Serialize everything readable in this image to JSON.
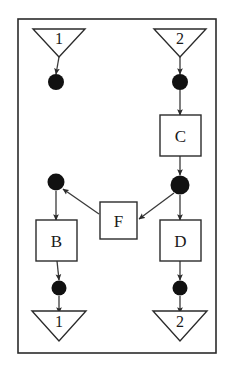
{
  "diagram": {
    "frame": {
      "name": "outer-frame",
      "x": 18,
      "y": 19,
      "width": 198,
      "height": 334,
      "stroke": "#2b2b2b",
      "fill": "#ffffff",
      "stroke_width": 1.6
    },
    "colors": {
      "stroke": "#2b2b2b",
      "line": "#3a3a3a",
      "place_fill": "#111111",
      "box_fill": "#ffffff",
      "background": "#ffffff",
      "text": "#1a1a1a"
    },
    "connectors": [
      {
        "id": "in-1",
        "label": "1",
        "role": "input-connector",
        "orientation": "down",
        "cx": 59,
        "y_top": 29,
        "half_width": 26,
        "height": 28,
        "label_dy": 9
      },
      {
        "id": "in-2",
        "label": "2",
        "role": "input-connector",
        "orientation": "down",
        "cx": 180,
        "y_top": 29,
        "half_width": 26,
        "height": 28,
        "label_dy": 9
      },
      {
        "id": "out-1",
        "label": "1",
        "role": "output-connector",
        "orientation": "down",
        "cx": 59,
        "y_top": 311,
        "half_width": 27,
        "height": 30,
        "label_dy": 10
      },
      {
        "id": "out-2",
        "label": "2",
        "role": "output-connector",
        "orientation": "down",
        "cx": 180,
        "y_top": 311,
        "half_width": 27,
        "height": 30,
        "label_dy": 10
      }
    ],
    "places": [
      {
        "id": "p-top-left",
        "role": "place",
        "cx": 56,
        "cy": 82,
        "r": 8
      },
      {
        "id": "p-top-right",
        "role": "place",
        "cx": 180,
        "cy": 82,
        "r": 8
      },
      {
        "id": "p-junction",
        "role": "place-junction",
        "cx": 180,
        "cy": 185,
        "r": 9.5
      },
      {
        "id": "p-mid-left",
        "role": "place",
        "cx": 56,
        "cy": 182,
        "r": 8.5
      },
      {
        "id": "p-bot-left",
        "role": "place",
        "cx": 59,
        "cy": 288,
        "r": 7.5
      },
      {
        "id": "p-bot-right",
        "role": "place",
        "cx": 180,
        "cy": 288,
        "r": 7.5
      }
    ],
    "boxes": [
      {
        "id": "box-c",
        "label": "C",
        "role": "transition",
        "x": 160,
        "y": 115,
        "width": 41,
        "height": 41
      },
      {
        "id": "box-b",
        "label": "B",
        "role": "transition",
        "x": 36,
        "y": 220,
        "width": 41,
        "height": 41
      },
      {
        "id": "box-d",
        "label": "D",
        "role": "transition",
        "x": 160,
        "y": 220,
        "width": 41,
        "height": 41
      },
      {
        "id": "box-f",
        "label": "F",
        "role": "transition",
        "x": 100,
        "y": 202,
        "width": 37,
        "height": 37
      }
    ],
    "edges": [
      {
        "id": "e-in1-ptl",
        "from": "in-1",
        "to": "p-top-left",
        "x1": 59,
        "y1": 57,
        "x2": 56,
        "y2": 74
      },
      {
        "id": "e-in2-ptr",
        "from": "in-2",
        "to": "p-top-right",
        "x1": 180,
        "y1": 57,
        "x2": 180,
        "y2": 74
      },
      {
        "id": "e-ptr-c",
        "from": "p-top-right",
        "to": "box-c",
        "x1": 180,
        "y1": 90,
        "x2": 180,
        "y2": 115
      },
      {
        "id": "e-c-junc",
        "from": "box-c",
        "to": "p-junction",
        "x1": 180,
        "y1": 156,
        "x2": 180,
        "y2": 175
      },
      {
        "id": "e-junc-f",
        "from": "p-junction",
        "to": "box-f",
        "x1": 174,
        "y1": 193,
        "x2": 139,
        "y2": 219
      },
      {
        "id": "e-f-pml",
        "from": "box-f",
        "to": "p-mid-left",
        "x1": 99,
        "y1": 214,
        "x2": 63,
        "y2": 189
      },
      {
        "id": "e-junc-d",
        "from": "p-junction",
        "to": "box-d",
        "x1": 180,
        "y1": 195,
        "x2": 180,
        "y2": 220
      },
      {
        "id": "e-pml-b",
        "from": "p-mid-left",
        "to": "box-b",
        "x1": 56,
        "y1": 191,
        "x2": 56,
        "y2": 220
      },
      {
        "id": "e-b-pbl",
        "from": "box-b",
        "to": "p-bot-left",
        "x1": 57,
        "y1": 261,
        "x2": 59,
        "y2": 280
      },
      {
        "id": "e-d-pbr",
        "from": "box-d",
        "to": "p-bot-right",
        "x1": 180,
        "y1": 261,
        "x2": 180,
        "y2": 280
      },
      {
        "id": "e-pbl-out1",
        "from": "p-bot-left",
        "to": "out-1",
        "x1": 59,
        "y1": 296,
        "x2": 59,
        "y2": 313
      },
      {
        "id": "e-pbr-out2",
        "from": "p-bot-right",
        "to": "out-2",
        "x1": 180,
        "y1": 296,
        "x2": 180,
        "y2": 313
      }
    ]
  }
}
